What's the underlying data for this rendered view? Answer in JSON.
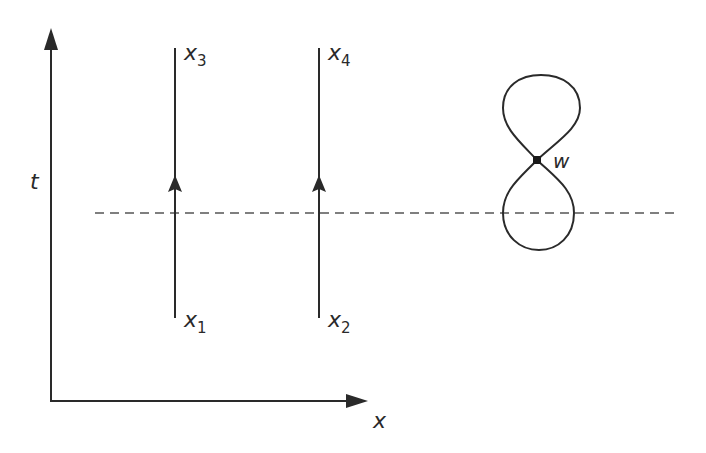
{
  "diagram": {
    "axes": {
      "vertical_label": "t",
      "horizontal_label": "x"
    },
    "worldlines": [
      {
        "id": "left",
        "top_label": "x",
        "top_subscript": "3",
        "bottom_label": "x",
        "bottom_subscript": "1",
        "direction": "up"
      },
      {
        "id": "right",
        "top_label": "x",
        "top_subscript": "4",
        "bottom_label": "x",
        "bottom_subscript": "2",
        "direction": "up"
      }
    ],
    "vertex": {
      "label": "w"
    },
    "time_slice": {
      "style": "dashed"
    },
    "colors": {
      "line": "#2a2a2a",
      "dashed": "#555555",
      "background": "#ffffff"
    }
  }
}
